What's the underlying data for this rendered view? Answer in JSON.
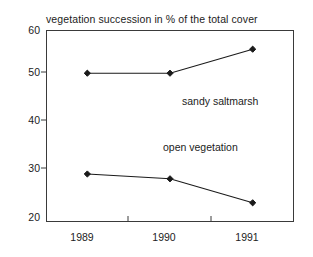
{
  "chart_data": {
    "type": "line",
    "title": "vegetation succession in % of the total cover",
    "xlabel": "",
    "ylabel": "",
    "categories": [
      "1989",
      "1990",
      "1991"
    ],
    "series": [
      {
        "name": "sandy saltmarsh",
        "values": [
          51,
          51,
          56
        ],
        "color": "#1a1a1a",
        "marker": "filled-diamond"
      },
      {
        "name": "open vegetation",
        "values": [
          30,
          29,
          24
        ],
        "color": "#1a1a1a",
        "marker": "filled-diamond"
      }
    ],
    "ylim": [
      20,
      60
    ],
    "yticks": [
      20,
      30,
      40,
      50,
      60
    ],
    "ytick_labels": [
      "20",
      "30",
      "40",
      "50",
      "60"
    ],
    "xtick_labels": [
      "1989",
      "1990",
      "1991"
    ],
    "grid": false,
    "legend": "inline-annotations",
    "annotations": [
      {
        "text": "sandy saltmarsh",
        "x_frac": 0.52,
        "value": 44.5
      },
      {
        "text": "open vegetation",
        "x_frac": 0.45,
        "value": 35.2
      }
    ]
  },
  "axis": {
    "y_top_label": "60",
    "y_labels": [
      "60",
      "50",
      "40",
      "30",
      "20"
    ],
    "x_labels": [
      "1989",
      "1990",
      "1991"
    ]
  }
}
